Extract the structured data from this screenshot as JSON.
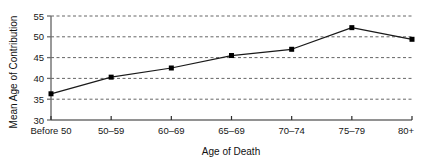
{
  "chart_data": {
    "type": "line",
    "title": "",
    "xlabel": "Age of Death",
    "ylabel": "Mean Age of Contribution",
    "categories": [
      "Before 50",
      "50–59",
      "60–69",
      "65–69",
      "70–74",
      "75–79",
      "80+"
    ],
    "values": [
      36.3,
      40.3,
      42.5,
      45.5,
      47.0,
      52.2,
      49.4
    ],
    "series": [
      {
        "name": "Mean Age of Contribution",
        "values": [
          36.3,
          40.3,
          42.5,
          45.5,
          47.0,
          52.2,
          49.4
        ]
      }
    ],
    "ylim": [
      30,
      55
    ],
    "yticks": [
      30,
      35,
      40,
      45,
      50,
      55
    ],
    "ytick_labels": [
      "30",
      "35",
      "40",
      "45",
      "50",
      "55"
    ],
    "grid": true,
    "grid_style": "dashed",
    "legend": "none",
    "marker": "square",
    "line_color": "#1a1a1a",
    "marker_color": "#000000",
    "grid_color": "#555555",
    "axis_color": "#6e6e6e",
    "background": "#ffffff"
  }
}
